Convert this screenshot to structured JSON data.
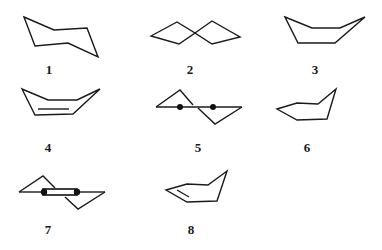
{
  "figure": {
    "colors": {
      "line": "#1a1a1a",
      "background": "#ffffff"
    },
    "structures": [
      {
        "id": "1",
        "label": "1",
        "kind": "chair-ring"
      },
      {
        "id": "2",
        "label": "2",
        "kind": "spiro-bicyclic"
      },
      {
        "id": "3",
        "label": "3",
        "kind": "boat-ring"
      },
      {
        "id": "4",
        "label": "4",
        "kind": "boat-ring-with-double-bond"
      },
      {
        "id": "5",
        "label": "5",
        "kind": "bridged-with-two-dots"
      },
      {
        "id": "6",
        "label": "6",
        "kind": "envelope-ring"
      },
      {
        "id": "7",
        "label": "7",
        "kind": "bridged-with-bar"
      },
      {
        "id": "8",
        "label": "8",
        "kind": "envelope-ring-with-double-bond"
      }
    ]
  }
}
